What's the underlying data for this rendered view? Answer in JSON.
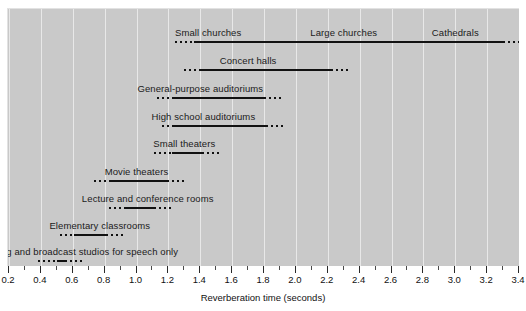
{
  "chart_data": {
    "type": "bar",
    "title": "",
    "xlabel": "Reverberation time (seconds)",
    "ylabel": "",
    "xlim": [
      0.2,
      3.4
    ],
    "grid": true,
    "legend": null,
    "orientation": "horizontal",
    "note": "Horizontal range bars; solid segment = typical range, dotted segments = extended/uncertain range",
    "tick_labels": [
      "0.2",
      "0.4",
      "0.6",
      "0.8",
      "1.0",
      "1.2",
      "1.4",
      "1.6",
      "1.8",
      "2.0",
      "2.2",
      "2.4",
      "2.6",
      "2.8",
      "3.0",
      "3.2",
      "3.4"
    ],
    "tick_values": [
      0.2,
      0.4,
      0.6,
      0.8,
      1.0,
      1.2,
      1.4,
      1.6,
      1.8,
      2.0,
      2.2,
      2.4,
      2.6,
      2.8,
      3.0,
      3.2,
      3.4
    ],
    "minor_tick_values": [
      0.3,
      0.5,
      0.7,
      0.9,
      1.1,
      1.3,
      1.5,
      1.7,
      1.9,
      2.1,
      2.3,
      2.5,
      2.7,
      2.9,
      3.1,
      3.3
    ],
    "categories": [
      "Small churches / Large churches / Cathedrals",
      "Concert halls",
      "General-purpose auditoriums",
      "High school auditoriums",
      "Small theaters",
      "Movie theaters",
      "Lecture and conference rooms",
      "Elementary classrooms",
      "Recording and broadcast studios for speech only"
    ],
    "rows": [
      {
        "label": "Small churches",
        "labels": [
          "Small churches",
          "Large churches",
          "Cathedrals"
        ],
        "label_positions": [
          1.45,
          2.3,
          3.0
        ],
        "dotted_start": 1.24,
        "solid_start": 1.36,
        "solid_end": 3.3,
        "dotted_end": 3.4
      },
      {
        "label": "Concert halls",
        "labels": [
          "Concert halls"
        ],
        "label_positions": [
          1.7
        ],
        "dotted_start": 1.3,
        "solid_start": 1.4,
        "solid_end": 2.22,
        "dotted_end": 2.33
      },
      {
        "label": "General-purpose auditoriums",
        "labels": [
          "General-purpose auditoriums"
        ],
        "label_positions": [
          1.4
        ],
        "dotted_start": 1.13,
        "solid_start": 1.22,
        "solid_end": 1.8,
        "dotted_end": 1.91
      },
      {
        "label": "High school auditoriums",
        "labels": [
          "High school auditoriums"
        ],
        "label_positions": [
          1.42
        ],
        "dotted_start": 1.16,
        "solid_start": 1.23,
        "solid_end": 1.81,
        "dotted_end": 1.92
      },
      {
        "label": "Small theaters",
        "labels": [
          "Small theaters"
        ],
        "label_positions": [
          1.3
        ],
        "dotted_start": 1.11,
        "solid_start": 1.22,
        "solid_end": 1.41,
        "dotted_end": 1.52
      },
      {
        "label": "Movie theaters",
        "labels": [
          "Movie theaters"
        ],
        "label_positions": [
          1.0
        ],
        "dotted_start": 0.73,
        "solid_start": 0.83,
        "solid_end": 1.19,
        "dotted_end": 1.31
      },
      {
        "label": "Lecture and conference rooms",
        "labels": [
          "Lecture and conference rooms"
        ],
        "label_positions": [
          1.07
        ],
        "dotted_start": 0.83,
        "solid_start": 0.92,
        "solid_end": 1.11,
        "dotted_end": 1.22
      },
      {
        "label": "Elementary classrooms",
        "labels": [
          "Elementary classrooms"
        ],
        "label_positions": [
          0.77
        ],
        "dotted_start": 0.52,
        "solid_start": 0.61,
        "solid_end": 0.81,
        "dotted_end": 0.92
      },
      {
        "label": "Recording and broadcast studios for speech only",
        "labels": [
          "Recording and broadcast studios for speech only"
        ],
        "label_positions": [
          0.6
        ],
        "dotted_start": 0.38,
        "solid_start": 0.5,
        "solid_end": 0.55,
        "dotted_end": 0.66
      }
    ]
  }
}
